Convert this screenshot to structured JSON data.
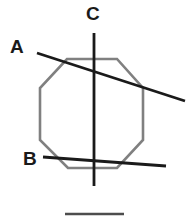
{
  "figure": {
    "title": "",
    "width": 191,
    "height": 219,
    "background_color": "#ffffff",
    "labels": [
      {
        "id": "A",
        "text": "A",
        "x": 10,
        "y": 37
      },
      {
        "id": "B",
        "text": "B",
        "x": 23,
        "y": 149
      },
      {
        "id": "C",
        "text": "C",
        "x": 86,
        "y": 4
      }
    ],
    "shapes": {
      "octagon": {
        "name": "octagon",
        "stroke_color": "#808080",
        "stroke_width": 2.6,
        "fill": "none",
        "points": "67,59 117,59 143,88 143,140 117,168 68,168 40,140 40,88"
      },
      "lines": [
        {
          "name": "line-a",
          "label": "A",
          "stroke_color": "#1a1a1a",
          "stroke_width": 2.8,
          "x1": 37,
          "y1": 53,
          "x2": 185,
          "y2": 101
        },
        {
          "name": "line-b",
          "label": "B",
          "stroke_color": "#1a1a1a",
          "stroke_width": 2.8,
          "x1": 43,
          "y1": 157,
          "x2": 166,
          "y2": 166
        },
        {
          "name": "line-c",
          "label": "C",
          "stroke_color": "#1a1a1a",
          "stroke_width": 2.8,
          "x1": 94,
          "y1": 33,
          "x2": 94,
          "y2": 186
        },
        {
          "name": "baseline-rule",
          "label": "",
          "stroke_color": "#4d4d4d",
          "stroke_width": 2.4,
          "x1": 65,
          "y1": 214,
          "x2": 124,
          "y2": 214
        }
      ]
    }
  }
}
